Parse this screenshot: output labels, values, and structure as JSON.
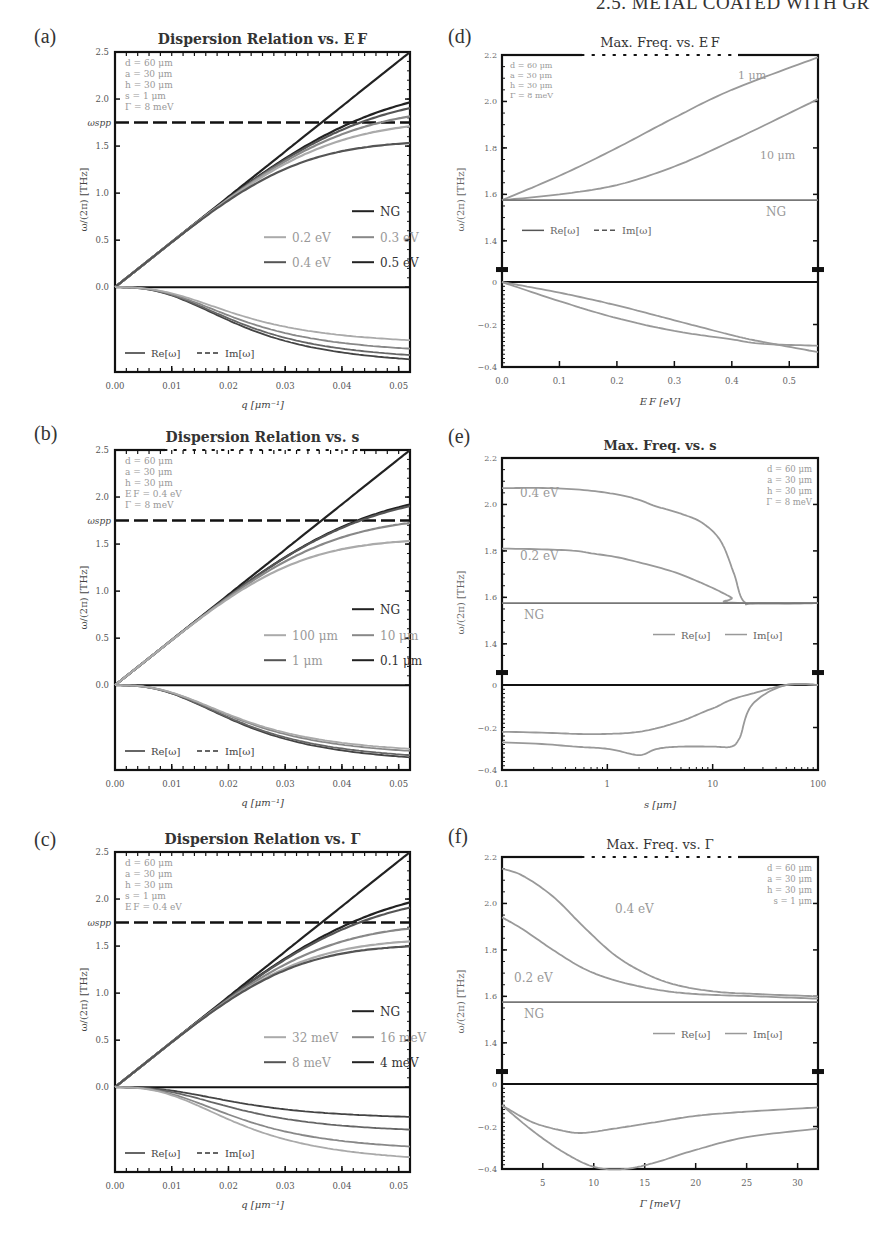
{
  "header": "2.5. METAL COATED WITH GR",
  "panel_labels": [
    "(a)",
    "(b)",
    "(c)",
    "(d)",
    "(e)",
    "(f)"
  ],
  "colors": {
    "axis": "#111111",
    "black": "#222222",
    "dark": "#555555",
    "mid": "#888888",
    "light": "#aaaaaa",
    "param": "#999999"
  },
  "chart_data": [
    {
      "id": "a",
      "type": "line",
      "title": "Dispersion Relation vs. E_F",
      "xlabel": "q [μm⁻¹]",
      "ylabel": "ω/(2π) [THz]",
      "xlim": [
        0,
        0.052
      ],
      "ylim_upper": [
        0,
        2.5
      ],
      "ylim_lower": [
        -0.4,
        0
      ],
      "xticks": [
        "0.00",
        "0.01",
        "0.02",
        "0.03",
        "0.04",
        "0.05"
      ],
      "yticks_upper": [
        "0.0",
        "0.5",
        "1.0",
        "1.5",
        "2.0",
        "2.5"
      ],
      "omega_spp_label": "ω_spp",
      "omega_spp": 1.75,
      "params": [
        "d = 60 μm",
        "a = 30 μm",
        "h = 30 μm",
        "s = 1 μm",
        "Γ = 8 meV"
      ],
      "legend": [
        "NG",
        "0.2 eV",
        "0.3 eV",
        "0.4 eV",
        "0.5 eV"
      ],
      "legend_reim": [
        "Re[ω]",
        "Im[ω]"
      ],
      "series_re": [
        {
          "name": "NG",
          "sat": 99,
          "color": "black"
        },
        {
          "name": "0.5 eV",
          "sat": 2.18,
          "color": "black"
        },
        {
          "name": "0.4 eV",
          "sat": 2.07,
          "color": "dark"
        },
        {
          "name": "0.3 eV",
          "sat": 1.93,
          "color": "mid"
        },
        {
          "name": "0.2 eV",
          "sat": 1.78,
          "color": "light"
        },
        {
          "name": "extra",
          "sat": 1.56,
          "color": "dark"
        }
      ],
      "series_im": [
        {
          "name": "0.5 eV",
          "min": -0.34
        },
        {
          "name": "0.4 eV",
          "min": -0.32
        },
        {
          "name": "0.3 eV",
          "min": -0.29
        },
        {
          "name": "0.2 eV",
          "min": -0.25
        }
      ]
    },
    {
      "id": "b",
      "type": "line",
      "title": "Dispersion Relation vs. s",
      "xlabel": "q [μm⁻¹]",
      "ylabel": "ω/(2π) [THz]",
      "xlim": [
        0,
        0.052
      ],
      "ylim_upper": [
        0,
        2.5
      ],
      "ylim_lower": [
        -0.4,
        0
      ],
      "xticks": [
        "0.00",
        "0.01",
        "0.02",
        "0.03",
        "0.04",
        "0.05"
      ],
      "yticks_upper": [
        "0.0",
        "0.5",
        "1.0",
        "1.5",
        "2.0",
        "2.5"
      ],
      "omega_spp_label": "ω_spp",
      "omega_spp": 1.75,
      "params": [
        "d = 60 μm",
        "a = 30 μm",
        "h = 30 μm",
        "E_F = 0.4 eV",
        "Γ = 8 meV"
      ],
      "legend": [
        "NG",
        "100 μm",
        "10 μm",
        "1 μm",
        "0.1 μm"
      ],
      "legend_reim": [
        "Re[ω]",
        "Im[ω]"
      ],
      "series_re": [
        {
          "name": "NG",
          "sat": 99,
          "color": "black"
        },
        {
          "name": "0.1 μm",
          "sat": 2.1,
          "color": "black"
        },
        {
          "name": "1 μm",
          "sat": 2.07,
          "color": "dark"
        },
        {
          "name": "10 μm",
          "sat": 1.8,
          "color": "mid"
        },
        {
          "name": "100 μm",
          "sat": 1.56,
          "color": "light"
        }
      ],
      "series_im": [
        {
          "name": "0.1 μm",
          "min": -0.34
        },
        {
          "name": "1 μm",
          "min": -0.33
        },
        {
          "name": "10 μm",
          "min": -0.31
        },
        {
          "name": "100 μm",
          "min": -0.3
        }
      ]
    },
    {
      "id": "c",
      "type": "line",
      "title": "Dispersion Relation vs. Γ",
      "xlabel": "q [μm⁻¹]",
      "ylabel": "ω/(2π) [THz]",
      "xlim": [
        0,
        0.052
      ],
      "ylim_upper": [
        0,
        2.5
      ],
      "ylim_lower": [
        -0.4,
        0
      ],
      "xticks": [
        "0.00",
        "0.01",
        "0.02",
        "0.03",
        "0.04",
        "0.05"
      ],
      "yticks_upper": [
        "0.0",
        "0.5",
        "1.0",
        "1.5",
        "2.0",
        "2.5"
      ],
      "omega_spp_label": "ω_spp",
      "omega_spp": 1.75,
      "params": [
        "d = 60 μm",
        "a = 30 μm",
        "h = 30 μm",
        "s = 1 μm",
        "E_F = 0.4 eV"
      ],
      "legend": [
        "NG",
        "32 meV",
        "16 meV",
        "8 meV",
        "4 meV"
      ],
      "legend_reim": [
        "Re[ω]",
        "Im[ω]"
      ],
      "series_re": [
        {
          "name": "NG",
          "sat": 99,
          "color": "black"
        },
        {
          "name": "4 meV",
          "sat": 2.18,
          "color": "black"
        },
        {
          "name": "8 meV",
          "sat": 2.08,
          "color": "dark"
        },
        {
          "name": "16 meV",
          "sat": 1.75,
          "color": "mid"
        },
        {
          "name": "32 meV",
          "sat": 1.58,
          "color": "light"
        },
        {
          "name": "extra",
          "sat": 1.52,
          "color": "dark"
        }
      ],
      "series_im": [
        {
          "name": "4 meV",
          "min": -0.14
        },
        {
          "name": "8 meV",
          "min": -0.2
        },
        {
          "name": "16 meV",
          "min": -0.28
        },
        {
          "name": "32 meV",
          "min": -0.33
        }
      ]
    },
    {
      "id": "d",
      "type": "line",
      "title": "Max. Freq. vs. E_F",
      "xlabel": "E_F [eV]",
      "ylabel": "ω/(2π) [THz]",
      "xlim": [
        0,
        0.55
      ],
      "ylim_upper": [
        1.3,
        2.2
      ],
      "ylim_lower": [
        -0.4,
        0
      ],
      "xticks": [
        "0.0",
        "0.1",
        "0.2",
        "0.3",
        "0.4",
        "0.5"
      ],
      "yticks_upper": [
        "1.4",
        "1.6",
        "1.8",
        "2.0",
        "2.2"
      ],
      "yticks_lower": [
        "0",
        "-0.2",
        "-0.4"
      ],
      "params": [
        "d = 60 μm",
        "a = 30 μm",
        "h = 30 μm",
        "Γ = 8 meV"
      ],
      "legend_reim": [
        "Re[ω]",
        "Im[ω]"
      ],
      "annotations": [
        "1 μm",
        "10 μm",
        "NG"
      ],
      "series_upper": [
        {
          "name": "1 μm",
          "x": [
            0,
            0.1,
            0.2,
            0.3,
            0.4,
            0.55
          ],
          "y": [
            1.575,
            1.68,
            1.8,
            1.93,
            2.05,
            2.19
          ]
        },
        {
          "name": "10 μm",
          "x": [
            0,
            0.1,
            0.2,
            0.3,
            0.4,
            0.55
          ],
          "y": [
            1.575,
            1.6,
            1.64,
            1.72,
            1.83,
            2.01
          ]
        },
        {
          "name": "NG",
          "x": [
            0,
            0.55
          ],
          "y": [
            1.575,
            1.575
          ]
        }
      ],
      "series_lower": [
        {
          "name": "1 μm",
          "x": [
            0,
            0.1,
            0.2,
            0.3,
            0.4,
            0.45,
            0.55
          ],
          "y": [
            0,
            -0.09,
            -0.17,
            -0.23,
            -0.27,
            -0.29,
            -0.3
          ]
        },
        {
          "name": "10 μm",
          "x": [
            0,
            0.1,
            0.2,
            0.3,
            0.4,
            0.45,
            0.55
          ],
          "y": [
            0,
            -0.05,
            -0.11,
            -0.18,
            -0.25,
            -0.28,
            -0.33
          ]
        }
      ]
    },
    {
      "id": "e",
      "type": "line",
      "title": "Max. Freq. vs. s",
      "xlabel": "s [μm]",
      "ylabel": "ω/(2π) [THz]",
      "xscale": "log",
      "xlim": [
        0.1,
        100
      ],
      "ylim_upper": [
        1.3,
        2.2
      ],
      "ylim_lower": [
        -0.4,
        0
      ],
      "xticks": [
        "0.1",
        "1",
        "10",
        "100"
      ],
      "yticks_upper": [
        "1.4",
        "1.6",
        "1.8",
        "2.0",
        "2.2"
      ],
      "yticks_lower": [
        "0",
        "-0.2",
        "-0.4"
      ],
      "params": [
        "d = 60 μm",
        "a = 30 μm",
        "h = 30 μm",
        "Γ = 8 meV"
      ],
      "legend_reim": [
        "Re[ω]",
        "Im[ω]"
      ],
      "annotations": [
        "0.4 eV",
        "0.2 eV",
        "NG"
      ],
      "series_upper": [
        {
          "name": "0.4 eV",
          "x": [
            0.1,
            0.3,
            1,
            2,
            3,
            5,
            8,
            12,
            16,
            20,
            30,
            100
          ],
          "y": [
            2.07,
            2.07,
            2.05,
            2.02,
            1.99,
            1.96,
            1.92,
            1.84,
            1.7,
            1.58,
            1.575,
            1.575
          ]
        },
        {
          "name": "0.2 eV",
          "x": [
            0.1,
            0.5,
            1,
            3,
            8,
            15,
            20,
            100
          ],
          "y": [
            1.81,
            1.8,
            1.78,
            1.73,
            1.66,
            1.6,
            1.575,
            1.575
          ]
        },
        {
          "name": "NG",
          "x": [
            0.1,
            100
          ],
          "y": [
            1.575,
            1.575
          ]
        }
      ],
      "series_lower": [
        {
          "name": "0.2 eV",
          "x": [
            0.1,
            0.5,
            1,
            2,
            5,
            10,
            20,
            50,
            100
          ],
          "y": [
            -0.22,
            -0.23,
            -0.23,
            -0.22,
            -0.17,
            -0.11,
            -0.05,
            0,
            0
          ]
        },
        {
          "name": "0.4 eV",
          "x": [
            0.1,
            0.5,
            1,
            2,
            3,
            5,
            10,
            15,
            18,
            25,
            50,
            100
          ],
          "y": [
            -0.27,
            -0.29,
            -0.3,
            -0.33,
            -0.3,
            -0.29,
            -0.29,
            -0.29,
            -0.25,
            -0.08,
            0,
            0
          ]
        }
      ]
    },
    {
      "id": "f",
      "type": "line",
      "title": "Max. Freq. vs. Γ",
      "xlabel": "Γ [meV]",
      "ylabel": "ω/(2π) [THz]",
      "xlim": [
        1,
        32
      ],
      "ylim_upper": [
        1.3,
        2.2
      ],
      "ylim_lower": [
        -0.4,
        0
      ],
      "xticks": [
        "5",
        "10",
        "15",
        "20",
        "25",
        "30"
      ],
      "yticks_upper": [
        "1.4",
        "1.6",
        "1.8",
        "2.0",
        "2.2"
      ],
      "yticks_lower": [
        "0",
        "-0.2",
        "-0.4"
      ],
      "params": [
        "d = 60 μm",
        "a = 30 μm",
        "h = 30 μm",
        "s = 1 μm"
      ],
      "legend_reim": [
        "Re[ω]",
        "Im[ω]"
      ],
      "annotations": [
        "0.4 eV",
        "0.2 eV",
        "NG"
      ],
      "series_upper": [
        {
          "name": "0.4 eV",
          "x": [
            1,
            3,
            6,
            9,
            12,
            15,
            18,
            22,
            26,
            32
          ],
          "y": [
            2.15,
            2.12,
            2.03,
            1.9,
            1.78,
            1.7,
            1.65,
            1.62,
            1.61,
            1.6
          ]
        },
        {
          "name": "0.2 eV",
          "x": [
            1,
            3,
            6,
            9,
            12,
            16,
            20,
            26,
            32
          ],
          "y": [
            1.94,
            1.89,
            1.8,
            1.72,
            1.67,
            1.63,
            1.61,
            1.6,
            1.59
          ]
        },
        {
          "name": "NG",
          "x": [
            1,
            32
          ],
          "y": [
            1.575,
            1.575
          ]
        }
      ],
      "series_lower": [
        {
          "name": "0.2 eV",
          "x": [
            1,
            4,
            7,
            9,
            12,
            16,
            20,
            25,
            32
          ],
          "y": [
            -0.1,
            -0.18,
            -0.22,
            -0.23,
            -0.21,
            -0.18,
            -0.15,
            -0.13,
            -0.11
          ]
        },
        {
          "name": "0.4 eV",
          "x": [
            1,
            4,
            7,
            10,
            13,
            16,
            20,
            25,
            32
          ],
          "y": [
            -0.1,
            -0.22,
            -0.32,
            -0.39,
            -0.4,
            -0.37,
            -0.31,
            -0.25,
            -0.21
          ]
        }
      ]
    }
  ]
}
